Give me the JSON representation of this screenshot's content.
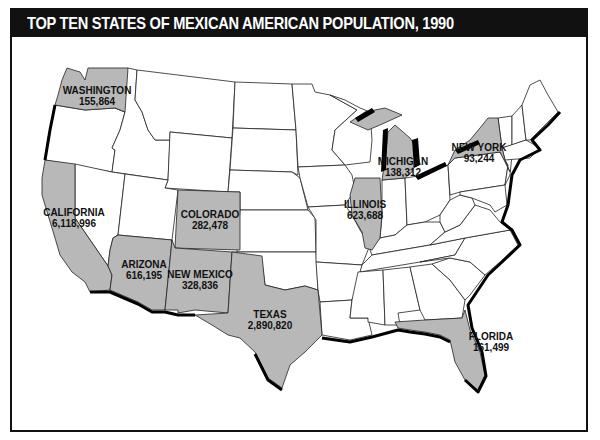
{
  "title": "TOP TEN STATES OF MEXICAN AMERICAN POPULATION, 1990",
  "colors": {
    "highlight_fill": "#b8b8b8",
    "state_fill": "#ffffff",
    "border": "#222222",
    "title_bar": "#111111",
    "title_text": "#ffffff"
  },
  "states": [
    {
      "name": "CALIFORNIA",
      "value": "6,118,996"
    },
    {
      "name": "TEXAS",
      "value": "2,890,820"
    },
    {
      "name": "ILLINOIS",
      "value": "623,688"
    },
    {
      "name": "ARIZONA",
      "value": "616,195"
    },
    {
      "name": "NEW MEXICO",
      "value": "328,836"
    },
    {
      "name": "COLORADO",
      "value": "282,478"
    },
    {
      "name": "FLORIDA",
      "value": "161,499"
    },
    {
      "name": "WASHINGTON",
      "value": "155,864"
    },
    {
      "name": "MICHIGAN",
      "value": "138,312"
    },
    {
      "name": "NEW YORK",
      "value": "93,244"
    }
  ]
}
